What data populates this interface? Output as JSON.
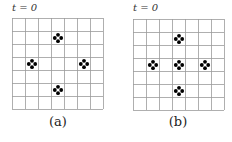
{
  "panels": [
    {
      "id": "a",
      "time_label": "t = 0",
      "caption": "(a)",
      "grid": {
        "rows": 7,
        "cols": 7
      },
      "clusters": [
        {
          "row": 1,
          "col": 3
        },
        {
          "row": 3,
          "col": 1
        },
        {
          "row": 3,
          "col": 5
        },
        {
          "row": 5,
          "col": 3
        }
      ]
    },
    {
      "id": "b",
      "time_label": "t = 0",
      "caption": "(b)",
      "grid": {
        "rows": 7,
        "cols": 7
      },
      "clusters": [
        {
          "row": 1,
          "col": 3
        },
        {
          "row": 3,
          "col": 1
        },
        {
          "row": 3,
          "col": 3
        },
        {
          "row": 3,
          "col": 5
        },
        {
          "row": 5,
          "col": 3
        }
      ]
    }
  ],
  "colors": {
    "grid": "#9a9a9a",
    "dot": "#000000"
  }
}
